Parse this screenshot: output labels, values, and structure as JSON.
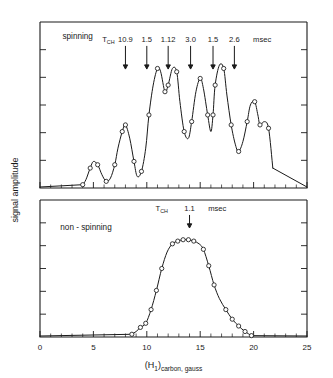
{
  "figure": {
    "xaxis": {
      "label_main": "(H",
      "label_sub": "1",
      "label_close": ")",
      "label_tail": "carbon, gauss",
      "ticks": [
        "0",
        "5",
        "10",
        "15",
        "20",
        "25"
      ],
      "min": 0,
      "max": 25,
      "major_step": 5,
      "minor_step": 1
    },
    "yaxis": {
      "label": "signal  amplitude",
      "ticks_count": 5
    },
    "panels": [
      {
        "id": "spinning",
        "title": "spinning",
        "annotation": {
          "symbol": "T",
          "subscript": "CH",
          "unit": "msec",
          "values": [
            "10.9",
            "1.5",
            "1.12",
            "3.0",
            "1.5",
            "2.6"
          ],
          "arrow_x": [
            8.0,
            10.0,
            12.0,
            14.1,
            16.2,
            18.2
          ]
        }
      },
      {
        "id": "non-spinning",
        "title": "non - spinning",
        "annotation": {
          "symbol": "T",
          "subscript": "CH",
          "unit": "msec",
          "values": [
            "1.1"
          ],
          "arrow_x": [
            14.0
          ]
        }
      }
    ]
  },
  "chart_data": [
    {
      "type": "line",
      "id": "spinning",
      "title": "spinning",
      "xlabel": "(H1)carbon, gauss",
      "ylabel": "signal amplitude",
      "xlim": [
        0,
        25
      ],
      "ylim": [
        0,
        100
      ],
      "grid": false,
      "legend": null,
      "marker": "open-circle",
      "annotations": [
        {
          "text": "TCH",
          "x": 6.4,
          "y": 88
        },
        {
          "text": "10.9",
          "x": 8.0,
          "y": 88,
          "arrow_to_y": 72
        },
        {
          "text": "1.5",
          "x": 10.0,
          "y": 88,
          "arrow_to_y": 72
        },
        {
          "text": "1.12",
          "x": 12.0,
          "y": 88,
          "arrow_to_y": 72
        },
        {
          "text": "3.0",
          "x": 14.1,
          "y": 88,
          "arrow_to_y": 72
        },
        {
          "text": "1.5",
          "x": 16.2,
          "y": 88,
          "arrow_to_y": 72
        },
        {
          "text": "2.6",
          "x": 18.2,
          "y": 88,
          "arrow_to_y": 72
        },
        {
          "text": "msec",
          "x": 20.8,
          "y": 88
        }
      ],
      "x": [
        4.0,
        4.3,
        4.7,
        5.0,
        5.4,
        5.8,
        6.2,
        6.6,
        7.0,
        7.3,
        7.7,
        8.0,
        8.4,
        8.8,
        9.1,
        9.5,
        9.9,
        10.2,
        10.6,
        11.0,
        11.3,
        11.7,
        12.0,
        12.4,
        12.8,
        13.1,
        13.5,
        13.9,
        14.2,
        14.6,
        15.0,
        15.3,
        15.7,
        16.0,
        16.2,
        16.4,
        16.8,
        17.2,
        17.5,
        17.9,
        18.3,
        18.6,
        19.0,
        19.4,
        19.7,
        20.1,
        20.4,
        20.6,
        21.0,
        21.4,
        21.8
      ],
      "y": [
        2,
        5,
        12,
        16,
        14,
        8,
        4,
        6,
        14,
        24,
        34,
        38,
        30,
        16,
        7,
        10,
        24,
        44,
        62,
        72,
        70,
        58,
        62,
        72,
        70,
        52,
        34,
        30,
        40,
        58,
        66,
        60,
        44,
        34,
        44,
        62,
        74,
        72,
        56,
        38,
        26,
        22,
        28,
        40,
        50,
        52,
        44,
        38,
        40,
        36,
        12
      ],
      "markers_x": [
        4.0,
        4.7,
        5.4,
        6.2,
        7.0,
        7.7,
        8.0,
        8.8,
        9.5,
        10.2,
        11.0,
        11.7,
        12.0,
        12.8,
        13.5,
        14.2,
        15.0,
        15.7,
        16.2,
        16.4,
        17.2,
        17.9,
        18.6,
        19.4,
        20.1,
        20.6,
        21.4
      ]
    },
    {
      "type": "line",
      "id": "non-spinning",
      "title": "non - spinning",
      "xlabel": "(H1)carbon, gauss",
      "ylabel": "signal amplitude",
      "xlim": [
        0,
        25
      ],
      "ylim": [
        0,
        100
      ],
      "grid": false,
      "legend": null,
      "marker": "open-circle",
      "annotations": [
        {
          "text": "TCH",
          "x": 11.4,
          "y": 92
        },
        {
          "text": "1.1",
          "x": 14.0,
          "y": 92,
          "arrow_to_y": 80
        },
        {
          "text": "msec",
          "x": 16.6,
          "y": 92
        }
      ],
      "x": [
        8.6,
        9.0,
        9.4,
        9.9,
        10.4,
        10.9,
        11.4,
        11.9,
        12.4,
        12.9,
        13.4,
        13.9,
        14.4,
        14.9,
        15.3,
        15.8,
        16.3,
        16.8,
        17.4,
        18.0,
        18.6,
        19.2,
        19.8
      ],
      "y": [
        2,
        4,
        7,
        10,
        20,
        34,
        50,
        62,
        68,
        70,
        71,
        71,
        70,
        68,
        64,
        52,
        38,
        28,
        20,
        13,
        8,
        4,
        1
      ],
      "markers_x": [
        8.6,
        9.4,
        9.9,
        10.4,
        10.9,
        11.4,
        12.4,
        12.9,
        13.4,
        13.9,
        14.4,
        15.3,
        15.8,
        16.3,
        17.4,
        18.0,
        18.6,
        19.2,
        19.8
      ]
    }
  ]
}
